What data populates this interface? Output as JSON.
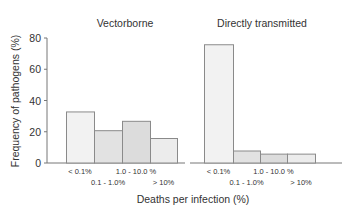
{
  "chart_data": {
    "type": "bar",
    "ylabel": "Frequency of pathogens (%)",
    "xlabel": "Deaths per infection (%)",
    "ylim": [
      0,
      80
    ],
    "yticks": [
      0,
      20,
      40,
      60,
      80
    ],
    "grid": false,
    "categories": [
      "< 0.1%",
      "0.1 - 1.0%",
      "1.0 - 10.0 %",
      "> 10%"
    ],
    "panels": [
      {
        "title": "Vectorborne",
        "categories": [
          "< 0.1%",
          "0.1 - 1.0%",
          "1.0 - 10.0 %",
          "> 10%"
        ],
        "values": [
          33,
          21,
          27,
          16
        ]
      },
      {
        "title": "Directly transmitted",
        "categories": [
          "< 0.1%",
          "0.1 - 1.0%",
          "1.0 - 10.0 %",
          "> 10%"
        ],
        "values": [
          76,
          8,
          6,
          6
        ]
      }
    ],
    "bar_colors": [
      "#f2f2f2",
      "#e2e2e2",
      "#dcdcdc",
      "#ececec"
    ],
    "bar_border": "#8a8a8a",
    "axis_color": "#777777"
  }
}
